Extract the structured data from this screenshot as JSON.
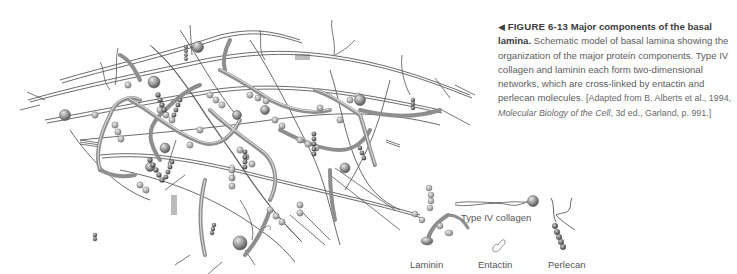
{
  "figure": {
    "arrow_glyph": "◀",
    "number": "FIGURE 6-13",
    "title": "Major components of the basal lamina.",
    "body": "Schematic model of basal lamina showing the organization of the major protein components. Type IV collagen and laminin each form two-dimensional networks, which are cross-linked by entactin and perlecan molecules.",
    "citation_prefix": "[Adapted from B. Alberts et al., 1994, ",
    "citation_book": "Molecular Biology of the Cell",
    "citation_suffix": ", 3d ed., Garland, p. 991.]"
  },
  "legend": {
    "items": [
      {
        "id": "laminin",
        "label": "Laminin"
      },
      {
        "id": "type-iv-collagen",
        "label": "Type IV collagen"
      },
      {
        "id": "entactin",
        "label": "Entactin"
      },
      {
        "id": "perlecan",
        "label": "Perlecan"
      }
    ]
  },
  "colors": {
    "fiber": "#5a5a5a",
    "laminin": "#9a9a9a",
    "ball": "#8c8c8c",
    "text": "#5d5d5d",
    "background": "#ffffff"
  }
}
